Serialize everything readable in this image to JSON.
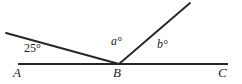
{
  "figure": {
    "background_color": "#ffffff",
    "stroke_color": "#272727",
    "text_color": "#1d1d1d",
    "width": 242,
    "height": 84,
    "points": {
      "A": {
        "label": "A",
        "x": 18,
        "y": 64
      },
      "B": {
        "label": "B",
        "x": 119,
        "y": 64
      },
      "C": {
        "label": "C",
        "x": 228,
        "y": 64
      },
      "left_ray_end": {
        "x": 6,
        "y": 33
      },
      "upper_ray_end": {
        "x": 190,
        "y": 3
      }
    },
    "segments": [
      {
        "name": "baseline-AC",
        "from": "A",
        "to": "C",
        "x1": 18,
        "y1": 64,
        "x2": 228,
        "y2": 64,
        "width": 2.1
      },
      {
        "name": "ray-B-upper-left",
        "from": "B",
        "to": "left_ray_end",
        "x1": 119,
        "y1": 64,
        "x2": 6,
        "y2": 33,
        "width": 1.9
      },
      {
        "name": "ray-B-upper-right",
        "from": "B",
        "to": "upper_ray_end",
        "x1": 119,
        "y1": 64,
        "x2": 190,
        "y2": 3,
        "width": 1.9
      }
    ],
    "angle_labels": {
      "left_angle": "25°",
      "middle_angle": "a°",
      "right_angle": "b°"
    },
    "vertex_labels": {
      "A": "A",
      "B": "B",
      "C": "C"
    }
  }
}
